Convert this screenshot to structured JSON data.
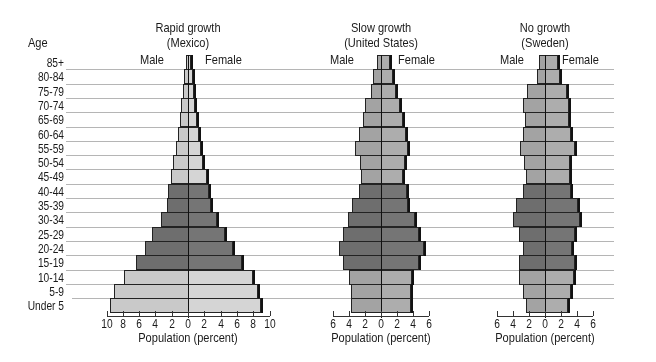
{
  "age_header": "Age",
  "sex_labels": {
    "male": "Male",
    "female": "Female"
  },
  "xlabel": "Population (percent)",
  "age_groups": [
    "85+",
    "80-84",
    "75-79",
    "70-74",
    "65-69",
    "60-64",
    "55-59",
    "50-54",
    "45-49",
    "40-44",
    "35-39",
    "30-34",
    "25-29",
    "20-24",
    "15-19",
    "10-14",
    "5-9",
    "Under 5"
  ],
  "colors": {
    "light": "#c9c9c9",
    "mid": "#a3a3a3",
    "dark": "#6e6e6e",
    "grid": "#b5b5b5"
  },
  "chart_data": [
    {
      "type": "bar",
      "orientation": "horizontal-pyramid",
      "title": "Rapid growth",
      "subtitle": "(Mexico)",
      "xlabel": "Population (percent)",
      "ylabel": "Age",
      "xlim": [
        -10,
        10
      ],
      "xticks": [
        "10",
        "8",
        "6",
        "4",
        "2",
        "0",
        "2",
        "4",
        "6",
        "8",
        "10"
      ],
      "categories": [
        "85+",
        "80-84",
        "75-79",
        "70-74",
        "65-69",
        "60-64",
        "55-59",
        "50-54",
        "45-49",
        "40-44",
        "35-39",
        "30-34",
        "25-29",
        "20-24",
        "15-19",
        "10-14",
        "5-9",
        "Under 5"
      ],
      "series": [
        {
          "name": "Male",
          "values": [
            0.3,
            0.5,
            0.6,
            0.8,
            1.0,
            1.2,
            1.5,
            1.8,
            2.1,
            2.5,
            2.6,
            3.3,
            4.4,
            5.3,
            6.4,
            7.8,
            9.1,
            9.6
          ]
        },
        {
          "name": "Female",
          "values": [
            0.4,
            0.6,
            0.7,
            0.9,
            1.1,
            1.3,
            1.6,
            1.9,
            2.3,
            2.6,
            2.8,
            3.5,
            4.6,
            5.5,
            6.6,
            8.0,
            8.6,
            8.9
          ]
        }
      ],
      "shade": [
        "light",
        "light",
        "light",
        "light",
        "light",
        "light",
        "light",
        "light",
        "light",
        "dark",
        "dark",
        "dark",
        "dark",
        "dark",
        "dark",
        "light",
        "light",
        "light"
      ]
    },
    {
      "type": "bar",
      "orientation": "horizontal-pyramid",
      "title": "Slow growth",
      "subtitle": "(United States)",
      "xlabel": "Population (percent)",
      "ylabel": "Age",
      "xlim": [
        -6,
        6
      ],
      "xticks": [
        "6",
        "4",
        "2",
        "0",
        "2",
        "4",
        "6"
      ],
      "categories": [
        "85+",
        "80-84",
        "75-79",
        "70-74",
        "65-69",
        "60-64",
        "55-59",
        "50-54",
        "45-49",
        "40-44",
        "35-39",
        "30-34",
        "25-29",
        "20-24",
        "15-19",
        "10-14",
        "5-9",
        "Under 5"
      ],
      "series": [
        {
          "name": "Male",
          "values": [
            0.5,
            1.0,
            1.3,
            2.0,
            2.3,
            2.8,
            3.3,
            2.6,
            2.5,
            2.8,
            3.6,
            4.1,
            4.7,
            5.2,
            4.8,
            4.0,
            3.7,
            3.7
          ]
        },
        {
          "name": "Female",
          "values": [
            1.1,
            1.5,
            1.9,
            2.4,
            2.8,
            3.1,
            3.4,
            3.0,
            2.8,
            3.2,
            3.4,
            4.2,
            4.8,
            5.4,
            4.7,
            3.9,
            3.7,
            3.7
          ]
        }
      ],
      "shade": [
        "mid",
        "mid",
        "mid",
        "mid",
        "mid",
        "mid",
        "mid",
        "mid",
        "mid",
        "dark",
        "dark",
        "dark",
        "dark",
        "dark",
        "dark",
        "mid",
        "mid",
        "mid"
      ]
    },
    {
      "type": "bar",
      "orientation": "horizontal-pyramid",
      "title": "No growth",
      "subtitle": "(Sweden)",
      "xlabel": "Population (percent)",
      "ylabel": "Age",
      "xlim": [
        -6,
        6
      ],
      "xticks": [
        "6",
        "4",
        "2",
        "0",
        "2",
        "4",
        "6"
      ],
      "categories": [
        "85+",
        "80-84",
        "75-79",
        "70-74",
        "65-69",
        "60-64",
        "55-59",
        "50-54",
        "45-49",
        "40-44",
        "35-39",
        "30-34",
        "25-29",
        "20-24",
        "15-19",
        "10-14",
        "5-9",
        "Under 5"
      ],
      "series": [
        {
          "name": "Male",
          "values": [
            0.7,
            1.0,
            2.2,
            2.8,
            2.5,
            2.8,
            3.1,
            2.6,
            2.4,
            2.7,
            3.6,
            4.0,
            3.2,
            2.8,
            3.3,
            3.3,
            2.8,
            2.4
          ]
        },
        {
          "name": "Female",
          "values": [
            1.6,
            1.9,
            2.7,
            3.0,
            3.0,
            3.3,
            3.7,
            3.1,
            3.1,
            3.3,
            4.1,
            4.4,
            3.7,
            3.4,
            3.8,
            3.6,
            3.2,
            2.9
          ]
        }
      ],
      "shade": [
        "mid",
        "mid",
        "mid",
        "mid",
        "mid",
        "mid",
        "mid",
        "mid",
        "mid",
        "dark",
        "dark",
        "dark",
        "dark",
        "dark",
        "dark",
        "mid",
        "mid",
        "mid"
      ]
    }
  ]
}
